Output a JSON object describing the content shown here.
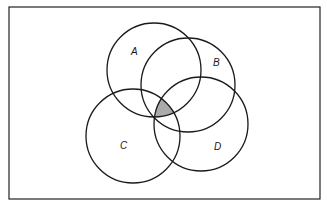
{
  "diagram": {
    "type": "venn",
    "frame": {
      "x": 9,
      "y": 7,
      "width": 311,
      "height": 192,
      "stroke": "#222222"
    },
    "stroke_color": "#1a1a1a",
    "shade_color": "#aaaaaa",
    "sets": [
      {
        "id": "A",
        "label": "A",
        "cx": 154,
        "cy": 70,
        "r": 47,
        "label_x": 131,
        "label_y": 55
      },
      {
        "id": "B",
        "label": "B",
        "cx": 188,
        "cy": 85,
        "r": 47,
        "label_x": 213,
        "label_y": 66
      },
      {
        "id": "C",
        "label": "C",
        "cx": 133,
        "cy": 136,
        "r": 47,
        "label_x": 120,
        "label_y": 149
      },
      {
        "id": "D",
        "label": "D",
        "cx": 201,
        "cy": 124,
        "r": 47,
        "label_x": 214,
        "label_y": 150
      }
    ],
    "shaded_region": "A ∩ B ∩ C ∩ D"
  }
}
